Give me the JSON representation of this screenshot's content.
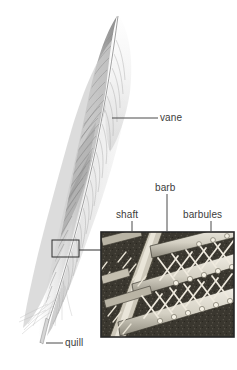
{
  "figure": {
    "background_color": "#ffffff",
    "ink_color": "#3c3c3c",
    "line_color": "#4a4a4a"
  },
  "labels": {
    "vane": "vane",
    "barb": "barb",
    "shaft": "shaft",
    "barbules": "barbules",
    "quill": "quill"
  },
  "caption": {
    "text": ""
  },
  "inset": {
    "name": "magnified-detail-inset",
    "border_color": "#2b2b2b",
    "fill_color": "#6d6a63",
    "description": "magnified view of interlocking barbs and barbules"
  },
  "callout": {
    "name": "callout-rectangle",
    "description": "small rectangle on feather vane marking magnified region"
  }
}
